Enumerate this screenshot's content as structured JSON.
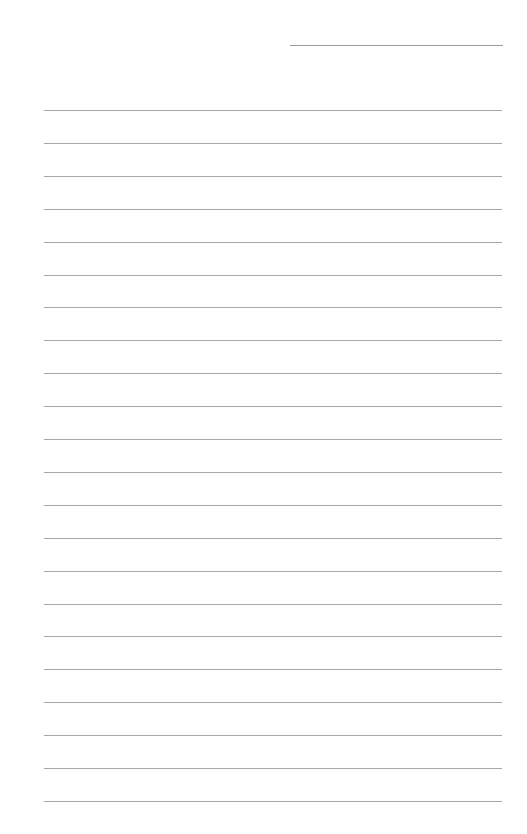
{
  "page": {
    "type": "lined-paper",
    "header_line": {
      "visible": true
    },
    "rules": {
      "count": 22,
      "first_y": 110,
      "spacing": 32.9,
      "color": "#a8a8a8"
    },
    "text": []
  }
}
